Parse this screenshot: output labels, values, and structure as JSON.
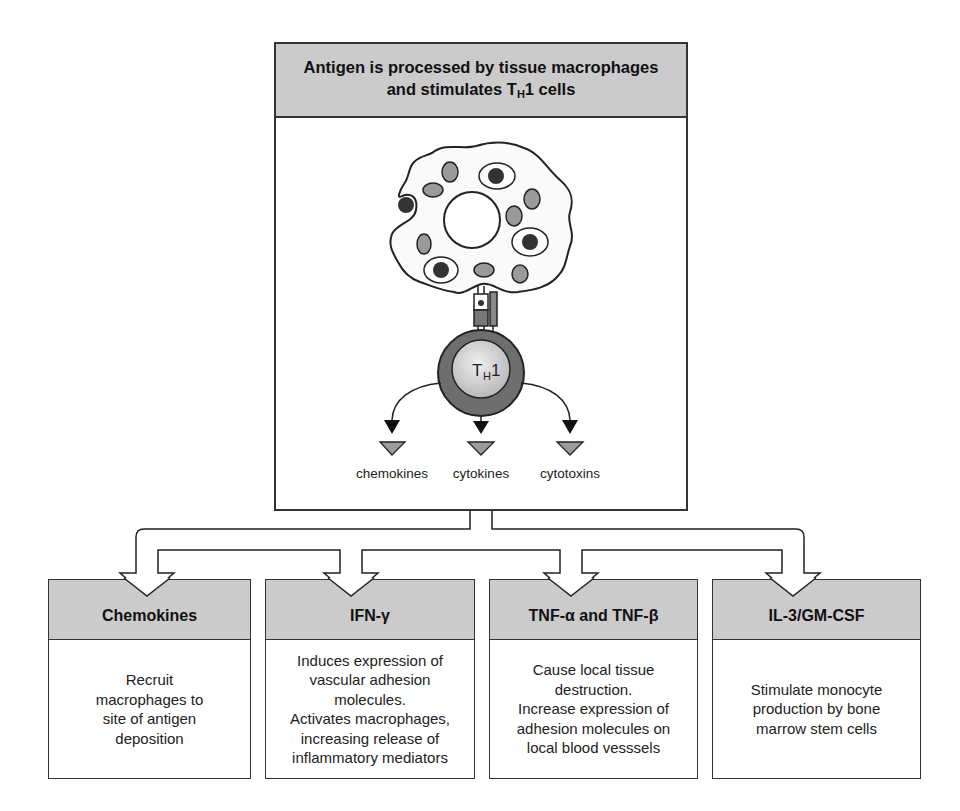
{
  "top_box": {
    "title_line1": "Antigen is processed by tissue macrophages",
    "title_line2_prefix": "and stimulates T",
    "title_line2_sub": "H",
    "title_line2_suffix": "1 cells"
  },
  "cell": {
    "macrophage_label": "macrophage",
    "th1_label_main": "T",
    "th1_label_sub": "H",
    "th1_label_suffix": "1"
  },
  "products": [
    {
      "label": "chemokines"
    },
    {
      "label": "cytokines"
    },
    {
      "label": "cytotoxins"
    }
  ],
  "effects": [
    {
      "title": "Chemokines",
      "body": "Recruit\nmacrophages to\nsite of antigen\ndeposition"
    },
    {
      "title": "IFN-γ",
      "body": "Induces expression of\nvascular adhesion\nmolecules.\nActivates macrophages,\nincreasing release of\ninflammatory mediators"
    },
    {
      "title": "TNF-α and TNF-β",
      "body": "Cause local tissue\ndestruction.\nIncrease expression of\nadhesion molecules on\nlocal blood vesssels"
    },
    {
      "title": "IL-3/GM-CSF",
      "body": "Stimulate monocyte\nproduction by bone\nmarrow stem cells"
    }
  ],
  "colors": {
    "header_gray": "#cbcbcb",
    "border": "#333333",
    "organelle_gray": "#9a9a9a",
    "th1_outer": "#6e6e6e",
    "th1_inner": "#d0d0d0",
    "product_triangle": "#9c9c9c"
  }
}
